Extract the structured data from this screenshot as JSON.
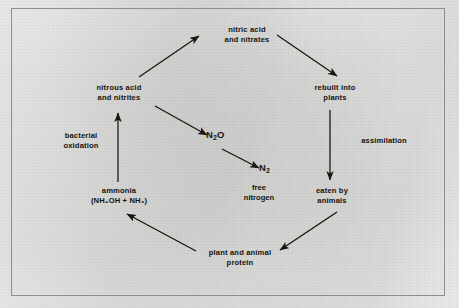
{
  "diagram": {
    "ink_color": "#15140f",
    "paper_color": "#f2f2f0",
    "border_color": "#8e8e8c",
    "nodes": [
      {
        "id": "nitric",
        "line1": "nitric acid",
        "line2": "and nitrates"
      },
      {
        "id": "nitrous",
        "line1": "nitrous acid",
        "line2": "and nitrites"
      },
      {
        "id": "rebuilt",
        "line1": "rebuilt into",
        "line2": "plants"
      },
      {
        "id": "ammonia",
        "line1": "ammonia",
        "line2": "(NH₄OH + NH₃)"
      },
      {
        "id": "eaten",
        "line1": "eaten by",
        "line2": "animals"
      },
      {
        "id": "protein",
        "line1": "plant and animal",
        "line2": "protein"
      }
    ],
    "processes": [
      {
        "id": "bacterial-oxidation",
        "line1": "bacterial",
        "line2": "oxidation"
      },
      {
        "id": "assimilation",
        "line1": "assimilation",
        "line2": ""
      }
    ],
    "species": [
      {
        "id": "n2o",
        "base": "N",
        "sub": "2",
        "tail": "O"
      },
      {
        "id": "n2",
        "base": "N",
        "sub": "2",
        "tail": ""
      }
    ],
    "captions": [
      {
        "id": "free-nitrogen",
        "line1": "free",
        "line2": "nitrogen"
      }
    ],
    "arrows": [
      {
        "id": "ammonia-to-nitrous",
        "from": "ammonia",
        "to": "nitrous",
        "direction": "up"
      },
      {
        "id": "nitrous-to-nitric",
        "from": "nitrous",
        "to": "nitric",
        "direction": "up-right"
      },
      {
        "id": "nitric-to-rebuilt",
        "from": "nitric",
        "to": "rebuilt",
        "direction": "down-right"
      },
      {
        "id": "rebuilt-to-eaten",
        "from": "rebuilt",
        "to": "eaten",
        "direction": "down"
      },
      {
        "id": "eaten-to-protein",
        "from": "eaten",
        "to": "protein",
        "direction": "down-left"
      },
      {
        "id": "protein-to-ammonia",
        "from": "protein",
        "to": "ammonia",
        "direction": "up-left"
      },
      {
        "id": "nitrous-to-n2o",
        "from": "nitrous",
        "to": "n2o",
        "direction": "down-right"
      },
      {
        "id": "n2o-to-n2",
        "from": "n2o",
        "to": "n2",
        "direction": "down-right"
      }
    ]
  }
}
